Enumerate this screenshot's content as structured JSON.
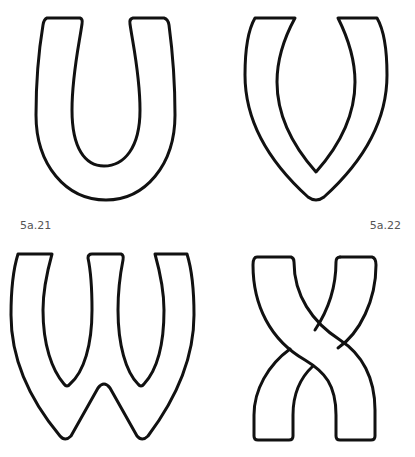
{
  "labels": {
    "first": "5a.21",
    "second": "5a.22"
  },
  "letters": [
    {
      "id": "U",
      "position": "top-left"
    },
    {
      "id": "V",
      "position": "top-right"
    },
    {
      "id": "W",
      "position": "bottom-left"
    },
    {
      "id": "X",
      "position": "bottom-right"
    }
  ],
  "colors": {
    "stroke": "#111111",
    "fill": "#ffffff",
    "label": "#555555"
  }
}
